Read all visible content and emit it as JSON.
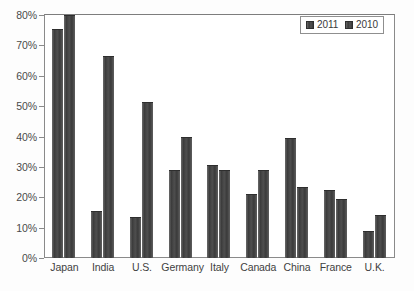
{
  "chart_data": {
    "type": "bar",
    "title": "",
    "xlabel": "",
    "ylabel": "",
    "ylim": [
      0,
      80
    ],
    "ytick_labels": [
      "0%",
      "10%",
      "20%",
      "30%",
      "40%",
      "50%",
      "60%",
      "70%",
      "80%"
    ],
    "ytick_values": [
      0,
      10,
      20,
      30,
      40,
      50,
      60,
      70,
      80
    ],
    "grid": false,
    "legend_position": "top-right",
    "categories": [
      "Japan",
      "India",
      "U.S.",
      "Germany",
      "Italy",
      "Canada",
      "China",
      "France",
      "U.K."
    ],
    "series": [
      {
        "name": "2011",
        "color": "#4d4d4d",
        "values": [
          75.5,
          15.5,
          13.5,
          29.0,
          30.5,
          21.0,
          39.5,
          22.5,
          9.0
        ]
      },
      {
        "name": "2010",
        "color": "#4d4d4d",
        "values": [
          80.0,
          66.5,
          51.5,
          40.0,
          29.0,
          29.0,
          23.5,
          19.5,
          14.0
        ]
      }
    ]
  },
  "legend": {
    "entries": [
      {
        "label": "2011",
        "swatch": "legend-swatch-2011"
      },
      {
        "label": "2010",
        "swatch": "legend-swatch-2010"
      }
    ]
  },
  "axes": {
    "y_ticks": [
      {
        "label": "80%",
        "value": 80
      },
      {
        "label": "70%",
        "value": 70
      },
      {
        "label": "60%",
        "value": 60
      },
      {
        "label": "50%",
        "value": 50
      },
      {
        "label": "40%",
        "value": 40
      },
      {
        "label": "30%",
        "value": 30
      },
      {
        "label": "20%",
        "value": 20
      },
      {
        "label": "10%",
        "value": 10
      },
      {
        "label": "0%",
        "value": 0
      }
    ]
  }
}
